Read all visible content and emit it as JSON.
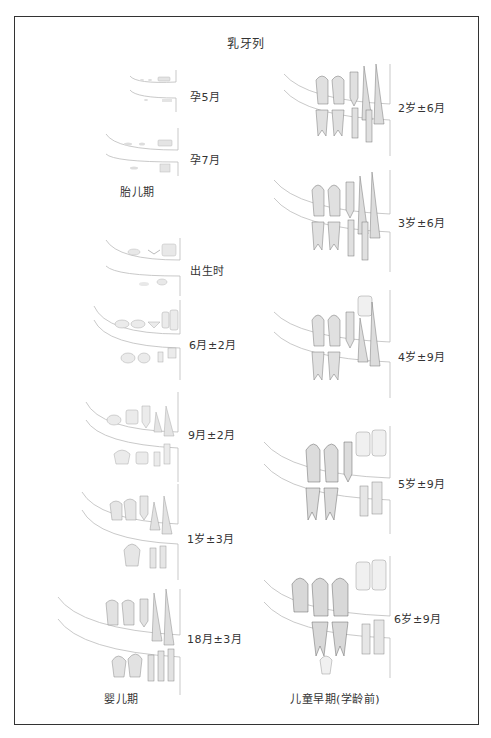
{
  "title": "乳牙列",
  "sections": {
    "fetal": "胎儿期",
    "infancy": "婴儿期",
    "early_childhood": "儿童早期(学龄前)"
  },
  "left_column": [
    {
      "label": "孕5月",
      "stage": "fetal"
    },
    {
      "label": "孕7月",
      "stage": "fetal"
    },
    {
      "label": "出生时",
      "stage": "infancy"
    },
    {
      "label": "6月±2月",
      "stage": "infancy"
    },
    {
      "label": "9月±2月",
      "stage": "infancy"
    },
    {
      "label": "1岁±3月",
      "stage": "infancy"
    },
    {
      "label": "18月±3月",
      "stage": "infancy"
    }
  ],
  "right_column": [
    {
      "label": "2岁±6月",
      "stage": "early_childhood"
    },
    {
      "label": "3岁±6月",
      "stage": "early_childhood"
    },
    {
      "label": "4岁±9月",
      "stage": "early_childhood"
    },
    {
      "label": "5岁±9月",
      "stage": "early_childhood"
    },
    {
      "label": "6岁±9月",
      "stage": "early_childhood"
    }
  ],
  "colors": {
    "border": "#333333",
    "tooth_outline": "#9a9a9a",
    "tooth_fill": "#ececec"
  }
}
